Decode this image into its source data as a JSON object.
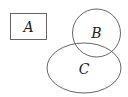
{
  "diagram": {
    "type": "venn-like",
    "stroke_color": "#555555",
    "text_color": "#222222",
    "sets": [
      {
        "id": "A",
        "label": "A",
        "shape": "rectangle",
        "overlaps": []
      },
      {
        "id": "B",
        "label": "B",
        "shape": "circle",
        "overlaps": [
          "C"
        ]
      },
      {
        "id": "C",
        "label": "C",
        "shape": "ellipse",
        "overlaps": [
          "B"
        ]
      }
    ]
  }
}
